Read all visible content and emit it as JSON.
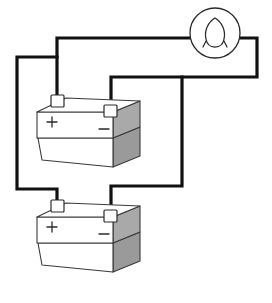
{
  "figure": {
    "background_color": "#ffffff",
    "ink_color": "#1a1a1a",
    "wire_color": "#111111",
    "shade_color": "#a9a9a9",
    "shade_color_dark": "#9a9a9a",
    "face_color": "#ffffff",
    "style": "isometric line drawing"
  },
  "lamp": {
    "name": "lamp",
    "label": "",
    "symbol": "light-bulb",
    "center_x": 215,
    "center_y": 33,
    "radius": 25,
    "filament": "teardrop loop"
  },
  "batteries": [
    {
      "id": "battery-top",
      "name": "Top battery",
      "positive_label": "+",
      "negative_label": "−",
      "positive_terminal": {
        "x": 58,
        "y": 98
      },
      "negative_terminal": {
        "x": 111,
        "y": 108
      },
      "origin_x": 0,
      "origin_y": 0
    },
    {
      "id": "battery-bottom",
      "name": "Bottom battery",
      "positive_label": "+",
      "negative_label": "−",
      "positive_terminal": {
        "x": 58,
        "y": 203
      },
      "negative_terminal": {
        "x": 111,
        "y": 213
      },
      "origin_x": 0,
      "origin_y": 105
    }
  ],
  "wires": [
    {
      "id": "wire-lamp-left-to-top-positive",
      "name": "lamp left lead to top battery positive",
      "path": "M 190 38 L 57 38 L 57 98"
    },
    {
      "id": "wire-parallel-positive-branch",
      "name": "positive parallel branch to bottom battery",
      "path": "M 57 57 L 17 57 L 17 189 L 57 189 L 57 203"
    },
    {
      "id": "wire-lamp-right-to-top-negative",
      "name": "lamp right lead to top battery negative",
      "path": "M 240 38 L 257 38 L 257 77 L 111 77 L 111 108"
    },
    {
      "id": "wire-parallel-negative-branch",
      "name": "negative parallel branch to bottom battery",
      "path": "M 182 77 L 182 186 L 111 186 L 111 213"
    }
  ]
}
